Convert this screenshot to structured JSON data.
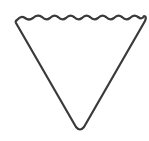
{
  "figure": {
    "shape": "inverted-triangle-wavy-top",
    "icon": "wavy-inverted-triangle-icon",
    "stroke_color": "#3a3a3a",
    "fill_color": "#ffffff",
    "background": "#ffffff"
  }
}
